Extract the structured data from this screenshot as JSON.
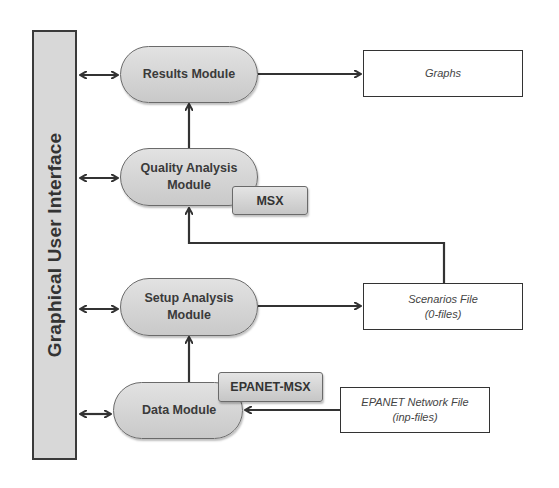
{
  "gui": {
    "label": "Graphical User Interface"
  },
  "modules": {
    "results": {
      "label": "Results Module"
    },
    "quality": {
      "line1": "Quality Analysis",
      "line2": "Module"
    },
    "setup": {
      "line1": "Setup Analysis",
      "line2": "Module"
    },
    "data": {
      "label": "Data Module"
    }
  },
  "tags": {
    "msx": "MSX",
    "epanet_msx": "EPANET-MSX"
  },
  "files": {
    "graphs": {
      "label": "Graphs"
    },
    "scenarios": {
      "line1": "Scenarios File",
      "line2": "(0-files)"
    },
    "epanet": {
      "line1": "EPANET Network File",
      "line2": "(inp-files)"
    }
  },
  "colors": {
    "module_fill": "#d4d4d4",
    "gui_fill": "#d8d8d8",
    "line": "#333333"
  }
}
